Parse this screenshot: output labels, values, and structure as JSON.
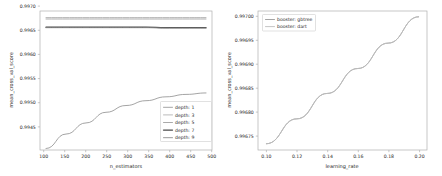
{
  "figures": [
    {
      "id": "left",
      "xlabel": "n_estimators",
      "ylabel": "mean_cross_val_score",
      "xticks": [
        "100",
        "150",
        "200",
        "250",
        "300",
        "350",
        "400",
        "450",
        "500"
      ],
      "yticks": [
        "0.9945",
        "0.9950",
        "0.9955",
        "0.9960",
        "0.9965",
        "0.9970"
      ],
      "legend": [
        {
          "label": "depth: 1",
          "color": "#9a9a9a"
        },
        {
          "label": "depth: 3",
          "color": "#b4b4b4"
        },
        {
          "label": "depth: 5",
          "color": "#a0a0a0"
        },
        {
          "label": "depth: 7",
          "color": "#4a4a4a"
        },
        {
          "label": "depth: 9",
          "color": "#8c8c8c"
        }
      ]
    },
    {
      "id": "right",
      "xlabel": "learning_rate",
      "ylabel": "mean_cross_val_score",
      "xticks": [
        "0.10",
        "0.12",
        "0.14",
        "0.16",
        "0.18",
        "0.20"
      ],
      "yticks": [
        "0.99675",
        "0.99680",
        "0.99685",
        "0.99690",
        "0.99695",
        "0.99700"
      ],
      "legend": [
        {
          "label": "booster: gbtree",
          "color": "#9a9a9a"
        },
        {
          "label": "booster: dart",
          "color": "#bdbdbd"
        }
      ]
    }
  ],
  "chart_data": [
    {
      "type": "line",
      "id": "left-panel",
      "title": "",
      "xlabel": "n_estimators",
      "ylabel": "mean_cross_val_score",
      "xlim": [
        85,
        515
      ],
      "ylim": [
        0.99425,
        0.997125
      ],
      "xticks": [
        100,
        150,
        200,
        250,
        300,
        350,
        400,
        450,
        500
      ],
      "yticks": [
        0.9945,
        0.995,
        0.9955,
        0.996,
        0.9965,
        0.997
      ],
      "grid": false,
      "legend_position": "lower right",
      "x": [
        100,
        150,
        200,
        250,
        300,
        350,
        400,
        450,
        500
      ],
      "series": [
        {
          "name": "depth: 1",
          "color": "#9a9a9a",
          "values": [
            0.99428,
            0.99458,
            0.99481,
            0.99503,
            0.99517,
            0.99527,
            0.99535,
            0.9954,
            0.99543
          ]
        },
        {
          "name": "depth: 3",
          "color": "#b4b4b4",
          "values": [
            0.99699,
            0.99699,
            0.99699,
            0.99699,
            0.99699,
            0.99699,
            0.99699,
            0.99699,
            0.99699
          ]
        },
        {
          "name": "depth: 5",
          "color": "#a0a0a0",
          "values": [
            0.99696,
            0.99696,
            0.99696,
            0.99696,
            0.99696,
            0.99696,
            0.99696,
            0.99696,
            0.99696
          ]
        },
        {
          "name": "depth: 7",
          "color": "#4a4a4a",
          "values": [
            0.99679,
            0.99679,
            0.99679,
            0.99679,
            0.99679,
            0.99679,
            0.99678,
            0.99678,
            0.99678
          ]
        },
        {
          "name": "depth: 9",
          "color": "#8c8c8c",
          "values": [
            0.99678,
            0.99678,
            0.99678,
            0.99678,
            0.99678,
            0.99678,
            0.99677,
            0.99677,
            0.99677
          ]
        }
      ]
    },
    {
      "type": "line",
      "id": "right-panel",
      "title": "",
      "xlabel": "learning_rate",
      "ylabel": "mean_cross_val_score",
      "xlim": [
        0.0945,
        0.2055
      ],
      "ylim": [
        0.996722,
        0.997012
      ],
      "xticks": [
        0.1,
        0.12,
        0.14,
        0.16,
        0.18,
        0.2
      ],
      "yticks": [
        0.99675,
        0.9968,
        0.99685,
        0.9969,
        0.99695,
        0.997
      ],
      "grid": false,
      "legend_position": "upper left",
      "x": [
        0.1,
        0.12,
        0.14,
        0.16,
        0.18,
        0.2
      ],
      "series": [
        {
          "name": "booster: gbtree",
          "color": "#9a9a9a",
          "values": [
            0.996735,
            0.996787,
            0.99684,
            0.996892,
            0.996945,
            0.997
          ]
        },
        {
          "name": "booster: dart",
          "color": "#bdbdbd",
          "values": [
            0.996735,
            0.996787,
            0.99684,
            0.996892,
            0.996945,
            0.997
          ]
        }
      ]
    }
  ]
}
